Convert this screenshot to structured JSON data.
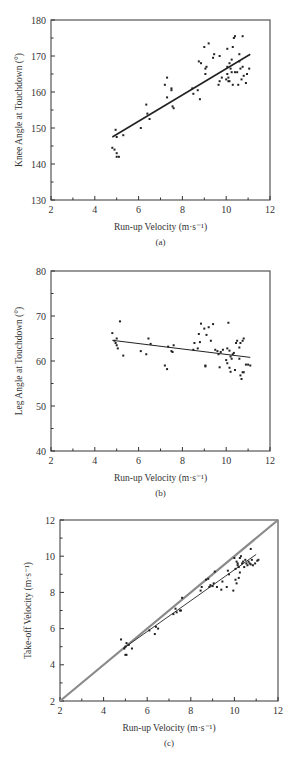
{
  "chart_data": [
    {
      "id": "a",
      "type": "scatter",
      "caption": "(a)",
      "title": "",
      "xlabel": "Run-up Velocity (m·s⁻¹)",
      "ylabel": "Knee Angle at Touchdown (°)",
      "xlim": [
        2,
        12
      ],
      "ylim": [
        130,
        180
      ],
      "xticks": [
        2,
        4,
        6,
        8,
        10,
        12
      ],
      "yticks": [
        130,
        140,
        150,
        160,
        170,
        180
      ],
      "grid": false,
      "frame": {
        "left": 51,
        "right": 270,
        "top": 20,
        "bottom": 200
      },
      "trendline": {
        "x": [
          4.8,
          11.1
        ],
        "y": [
          147.5,
          170.5
        ],
        "width": 1.6
      },
      "points": [
        [
          4.8,
          144.5
        ],
        [
          4.9,
          144
        ],
        [
          4.95,
          149.5
        ],
        [
          5.0,
          147.5
        ],
        [
          5.0,
          143
        ],
        [
          5.0,
          142
        ],
        [
          5.1,
          142
        ],
        [
          5.3,
          148
        ],
        [
          6.1,
          150
        ],
        [
          6.35,
          156.5
        ],
        [
          6.4,
          154
        ],
        [
          6.5,
          152.5
        ],
        [
          7.2,
          162
        ],
        [
          7.3,
          164
        ],
        [
          7.3,
          158.5
        ],
        [
          7.5,
          161
        ],
        [
          7.5,
          160.5
        ],
        [
          7.55,
          156
        ],
        [
          7.6,
          155.5
        ],
        [
          8.45,
          161
        ],
        [
          8.5,
          159.5
        ],
        [
          8.7,
          160.5
        ],
        [
          8.75,
          168.5
        ],
        [
          8.8,
          158
        ],
        [
          8.85,
          168
        ],
        [
          9.0,
          172.5
        ],
        [
          9.05,
          166.5
        ],
        [
          9.05,
          165
        ],
        [
          9.1,
          167
        ],
        [
          9.2,
          173.5
        ],
        [
          9.4,
          169.5
        ],
        [
          9.45,
          170.5
        ],
        [
          9.65,
          162
        ],
        [
          9.7,
          163
        ],
        [
          9.7,
          170
        ],
        [
          9.8,
          164
        ],
        [
          10.0,
          163.5
        ],
        [
          10.05,
          167
        ],
        [
          10.05,
          172
        ],
        [
          10.05,
          165
        ],
        [
          10.1,
          163
        ],
        [
          10.1,
          164
        ],
        [
          10.15,
          168
        ],
        [
          10.15,
          163
        ],
        [
          10.2,
          166.5
        ],
        [
          10.25,
          169
        ],
        [
          10.25,
          165.5
        ],
        [
          10.3,
          172.5
        ],
        [
          10.3,
          162
        ],
        [
          10.35,
          175
        ],
        [
          10.4,
          175.5
        ],
        [
          10.4,
          165.5
        ],
        [
          10.5,
          165.5
        ],
        [
          10.55,
          162
        ],
        [
          10.6,
          170.5
        ],
        [
          10.6,
          168.5
        ],
        [
          10.65,
          166.5
        ],
        [
          10.7,
          163.5
        ],
        [
          10.75,
          175.5
        ],
        [
          10.75,
          167
        ],
        [
          10.8,
          164.5
        ],
        [
          10.9,
          162.5
        ],
        [
          10.95,
          165
        ],
        [
          11.05,
          166.5
        ]
      ]
    },
    {
      "id": "b",
      "type": "scatter",
      "caption": "(b)",
      "title": "",
      "xlabel": "Run-up Velocity (m·s⁻¹)",
      "ylabel": "Leg Angle at Touchdown (°)",
      "xlim": [
        2,
        12
      ],
      "ylim": [
        40,
        80
      ],
      "xticks": [
        2,
        4,
        6,
        8,
        10,
        12
      ],
      "yticks": [
        40,
        50,
        60,
        70,
        80
      ],
      "grid": false,
      "frame": {
        "left": 51,
        "right": 270,
        "top": 271,
        "bottom": 451
      },
      "trendline": {
        "x": [
          4.8,
          11.1
        ],
        "y": [
          64.6,
          60.8
        ],
        "width": 1.0
      },
      "points": [
        [
          4.8,
          66.2
        ],
        [
          4.9,
          64.5
        ],
        [
          4.95,
          64
        ],
        [
          5.0,
          65
        ],
        [
          5.0,
          63.5
        ],
        [
          5.05,
          62.8
        ],
        [
          5.15,
          68.8
        ],
        [
          5.3,
          61.2
        ],
        [
          6.1,
          62.2
        ],
        [
          6.35,
          61.5
        ],
        [
          6.45,
          65
        ],
        [
          6.55,
          63.8
        ],
        [
          7.2,
          59
        ],
        [
          7.3,
          58.2
        ],
        [
          7.35,
          63.2
        ],
        [
          7.5,
          62.2
        ],
        [
          7.55,
          62
        ],
        [
          7.6,
          63.5
        ],
        [
          8.5,
          62.5
        ],
        [
          8.55,
          64
        ],
        [
          8.7,
          62.8
        ],
        [
          8.75,
          66
        ],
        [
          8.8,
          64.2
        ],
        [
          8.85,
          68.3
        ],
        [
          9.0,
          67.2
        ],
        [
          9.05,
          59
        ],
        [
          9.05,
          58.8
        ],
        [
          9.1,
          65.8
        ],
        [
          9.2,
          67.5
        ],
        [
          9.3,
          64.5
        ],
        [
          9.4,
          68.2
        ],
        [
          9.5,
          62.5
        ],
        [
          9.6,
          62.2
        ],
        [
          9.65,
          61.5
        ],
        [
          9.7,
          58.6
        ],
        [
          9.75,
          62
        ],
        [
          9.85,
          62.5
        ],
        [
          10.0,
          60.2
        ],
        [
          10.05,
          59.5
        ],
        [
          10.05,
          62.8
        ],
        [
          10.1,
          68.5
        ],
        [
          10.15,
          62.3
        ],
        [
          10.15,
          58.5
        ],
        [
          10.2,
          61
        ],
        [
          10.2,
          57.6
        ],
        [
          10.25,
          60.5
        ],
        [
          10.3,
          61.5
        ],
        [
          10.35,
          61.8
        ],
        [
          10.4,
          58
        ],
        [
          10.45,
          64
        ],
        [
          10.5,
          64.5
        ],
        [
          10.6,
          63
        ],
        [
          10.6,
          60.5
        ],
        [
          10.65,
          56.8
        ],
        [
          10.65,
          64
        ],
        [
          10.7,
          56
        ],
        [
          10.75,
          64.5
        ],
        [
          10.75,
          57.5
        ],
        [
          10.8,
          65
        ],
        [
          10.8,
          57.5
        ],
        [
          10.9,
          59.2
        ],
        [
          11.0,
          59.2
        ],
        [
          11.1,
          59
        ]
      ]
    },
    {
      "id": "c",
      "type": "scatter",
      "caption": "(c)",
      "title": "",
      "xlabel": "Run-up Velocity (m·s⁻¹)",
      "ylabel": "Take-off Velocity (m·s⁻¹)",
      "xlim": [
        2,
        12
      ],
      "ylim": [
        2,
        12
      ],
      "xticks": [
        2,
        4,
        6,
        8,
        10,
        12
      ],
      "yticks": [
        2,
        4,
        6,
        8,
        10,
        12
      ],
      "grid": false,
      "frame": {
        "left": 60,
        "right": 278,
        "top": 520,
        "bottom": 701
      },
      "identity_line": {
        "x": [
          2,
          12
        ],
        "y": [
          2,
          12
        ],
        "width": 2.2,
        "color": "#8a8a8a"
      },
      "trendline": {
        "x": [
          4.9,
          11.0
        ],
        "y": [
          4.9,
          10.1
        ],
        "width": 0.9
      },
      "points": [
        [
          4.8,
          5.4
        ],
        [
          4.95,
          4.9
        ],
        [
          5.0,
          5.0
        ],
        [
          5.0,
          4.55
        ],
        [
          5.05,
          4.55
        ],
        [
          5.05,
          5.2
        ],
        [
          5.15,
          5.1
        ],
        [
          5.3,
          4.9
        ],
        [
          6.1,
          5.9
        ],
        [
          6.35,
          5.7
        ],
        [
          6.4,
          6.1
        ],
        [
          6.5,
          6.0
        ],
        [
          7.2,
          6.8
        ],
        [
          7.3,
          7.1
        ],
        [
          7.35,
          6.9
        ],
        [
          7.5,
          7.0
        ],
        [
          7.55,
          7.0
        ],
        [
          7.6,
          7.7
        ],
        [
          8.45,
          8.1
        ],
        [
          8.5,
          8.3
        ],
        [
          8.7,
          8.7
        ],
        [
          8.8,
          8.75
        ],
        [
          8.85,
          8.3
        ],
        [
          8.9,
          8.4
        ],
        [
          9.0,
          8.35
        ],
        [
          9.05,
          8.5
        ],
        [
          9.1,
          9.15
        ],
        [
          9.2,
          8.3
        ],
        [
          9.4,
          8.15
        ],
        [
          9.45,
          8.6
        ],
        [
          9.65,
          8.3
        ],
        [
          9.7,
          9.2
        ],
        [
          9.75,
          9.0
        ],
        [
          9.95,
          8.1
        ],
        [
          10.0,
          9.9
        ],
        [
          10.05,
          8.7
        ],
        [
          10.05,
          9.3
        ],
        [
          10.1,
          8.5
        ],
        [
          10.1,
          9.7
        ],
        [
          10.15,
          9.6
        ],
        [
          10.15,
          9.5
        ],
        [
          10.2,
          8.8
        ],
        [
          10.2,
          9.4
        ],
        [
          10.25,
          9.9
        ],
        [
          10.25,
          9.1
        ],
        [
          10.3,
          10.0
        ],
        [
          10.35,
          9.6
        ],
        [
          10.4,
          9.7
        ],
        [
          10.45,
          9.4
        ],
        [
          10.5,
          9.8
        ],
        [
          10.55,
          9.6
        ],
        [
          10.6,
          9.5
        ],
        [
          10.65,
          9.7
        ],
        [
          10.7,
          9.6
        ],
        [
          10.75,
          10.4
        ],
        [
          10.75,
          9.55
        ],
        [
          10.8,
          9.8
        ],
        [
          10.85,
          9.5
        ],
        [
          10.95,
          9.6
        ],
        [
          11.05,
          9.75
        ],
        [
          11.1,
          9.8
        ]
      ]
    }
  ]
}
